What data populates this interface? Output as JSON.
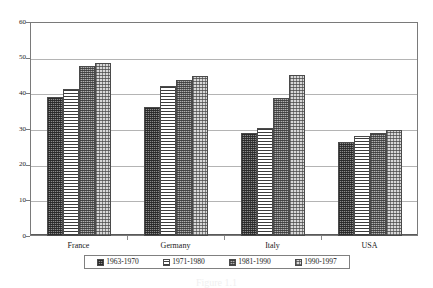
{
  "chart_data": {
    "type": "bar",
    "title": "",
    "xlabel": "",
    "ylabel": "",
    "ylim": [
      0,
      60
    ],
    "yticks": [
      0,
      10,
      20,
      30,
      40,
      50,
      60
    ],
    "grid": true,
    "legend_position": "bottom",
    "categories": [
      "France",
      "Germany",
      "Italy",
      "USA"
    ],
    "series": [
      {
        "name": "1963-1970",
        "values": [
          39.0,
          36.2,
          28.9,
          26.4
        ]
      },
      {
        "name": "1971-1980",
        "values": [
          41.3,
          42.0,
          30.3,
          28.0
        ]
      },
      {
        "name": "1981-1990",
        "values": [
          47.8,
          43.7,
          38.8,
          29.0
        ]
      },
      {
        "name": "1990-1997",
        "values": [
          48.5,
          44.9,
          45.1,
          29.6
        ]
      }
    ]
  },
  "axis": {
    "y_tick_labels": [
      "60",
      "50",
      "40",
      "30",
      "20",
      "10",
      "0"
    ]
  },
  "legend": {
    "items": [
      {
        "label": "1963-1970",
        "swatch": "pattern-dark-dither"
      },
      {
        "label": "1971-1980",
        "swatch": "pattern-horizontal-lines"
      },
      {
        "label": "1981-1990",
        "swatch": "pattern-medium-checker"
      },
      {
        "label": "1990-1997",
        "swatch": "pattern-light-checker"
      }
    ]
  },
  "caption": {
    "text": "Figure 1.1"
  }
}
